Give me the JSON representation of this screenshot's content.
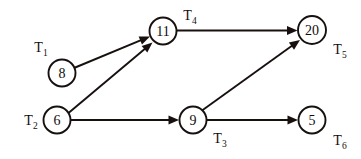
{
  "diagram": {
    "background_color": "#ffffff",
    "stroke_color": "#17100f",
    "node_fill_color": "#ffffff",
    "nodes": [
      {
        "id": "n8",
        "value": "8",
        "label": "T",
        "label_sub": "1",
        "cx": 62,
        "cy": 73,
        "r": 13.5,
        "label_x": 41,
        "label_y": 52
      },
      {
        "id": "n11",
        "value": "11",
        "label": "T",
        "label_sub": "4",
        "cx": 163,
        "cy": 31,
        "r": 13.5,
        "label_x": 190,
        "label_y": 20
      },
      {
        "id": "n20",
        "value": "20",
        "label": "T",
        "label_sub": "5",
        "cx": 312,
        "cy": 30,
        "r": 14.0,
        "label_x": 340,
        "label_y": 54
      },
      {
        "id": "n6",
        "value": "6",
        "label": "T",
        "label_sub": "2",
        "cx": 57,
        "cy": 120,
        "r": 13.5,
        "label_x": 31,
        "label_y": 125
      },
      {
        "id": "n9",
        "value": "9",
        "label": "T",
        "label_sub": "3",
        "cx": 193,
        "cy": 120,
        "r": 13.5,
        "label_x": 220,
        "label_y": 143
      },
      {
        "id": "n5",
        "value": "5",
        "label": "T",
        "label_sub": "6",
        "cx": 312,
        "cy": 120,
        "r": 13.5,
        "label_x": 340,
        "label_y": 145
      }
    ],
    "edges": [
      {
        "id": "e-8-11",
        "from": "n8",
        "to": "n11",
        "x1": 74.0,
        "y1": 68.0,
        "x2": 150.0,
        "y2": 36.5
      },
      {
        "id": "e-6-11",
        "from": "n6",
        "to": "n11",
        "x1": 68.5,
        "y1": 113.0,
        "x2": 152.5,
        "y2": 42.5
      },
      {
        "id": "e-11-20",
        "from": "n11",
        "to": "n20",
        "x1": 176.5,
        "y1": 30.5,
        "x2": 297.5,
        "y2": 30.5
      },
      {
        "id": "e-6-9",
        "from": "n6",
        "to": "n9",
        "x1": 70.5,
        "y1": 120.0,
        "x2": 179.0,
        "y2": 120.0
      },
      {
        "id": "e-9-20",
        "from": "n9",
        "to": "n20",
        "x1": 202.0,
        "y1": 110.5,
        "x2": 300.0,
        "y2": 40.0
      },
      {
        "id": "e-9-5",
        "from": "n9",
        "to": "n5",
        "x1": 206.5,
        "y1": 120.0,
        "x2": 298.0,
        "y2": 120.0
      }
    ]
  }
}
